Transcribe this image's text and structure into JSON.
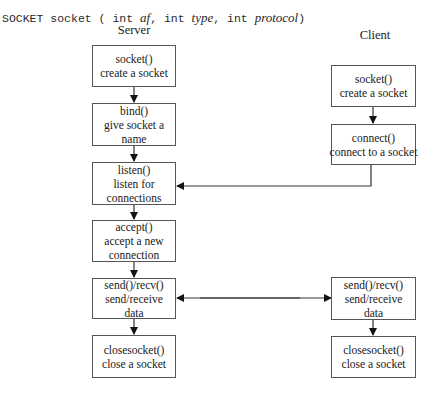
{
  "signature": {
    "prefix": "SOCKET socket ( int ",
    "arg1": "af",
    "sep1": ",  int ",
    "arg2": "type",
    "sep2": ", int ",
    "arg3": "protocol",
    "suffix": ")"
  },
  "columns": {
    "server": "Server",
    "client": "Client"
  },
  "server": {
    "socket": {
      "call": "socket()",
      "desc": [
        "create a socket"
      ]
    },
    "bind": {
      "call": "bind()",
      "desc": [
        "give socket a",
        "name"
      ]
    },
    "listen": {
      "call": "listen()",
      "desc": [
        "listen for",
        "connections"
      ]
    },
    "accept": {
      "call": "accept()",
      "desc": [
        "accept a new",
        "connection"
      ]
    },
    "sendrecv": {
      "call": "send()/recv()",
      "desc": [
        "send/receive",
        "data"
      ]
    },
    "close": {
      "call": "closesocket()",
      "desc": [
        "close a socket"
      ]
    }
  },
  "client": {
    "socket": {
      "call": "socket()",
      "desc": [
        "create a socket"
      ]
    },
    "connect": {
      "call": "connect()",
      "desc": [
        "connect to a socket"
      ]
    },
    "sendrecv": {
      "call": "send()/recv()",
      "desc": [
        "send/receive",
        "data"
      ]
    },
    "close": {
      "call": "closesocket()",
      "desc": [
        "close a socket"
      ]
    }
  }
}
